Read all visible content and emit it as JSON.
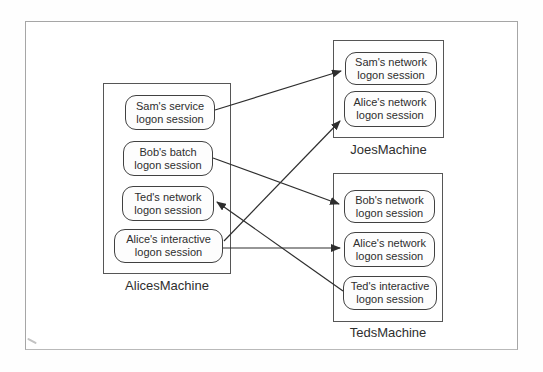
{
  "diagram": {
    "machines": [
      {
        "id": "alices-machine",
        "label": "AlicesMachine",
        "sessions": [
          {
            "id": "sam-service",
            "line1": "Sam's service",
            "line2": "logon session"
          },
          {
            "id": "bob-batch",
            "line1": "Bob's batch",
            "line2": "logon session"
          },
          {
            "id": "ted-network",
            "line1": "Ted's network",
            "line2": "logon session"
          },
          {
            "id": "alice-interactive",
            "line1": "Alice's interactive",
            "line2": "logon session"
          }
        ]
      },
      {
        "id": "joes-machine",
        "label": "JoesMachine",
        "sessions": [
          {
            "id": "sam-network",
            "line1": "Sam's network",
            "line2": "logon session"
          },
          {
            "id": "alice-network-joes",
            "line1": "Alice's network",
            "line2": "logon session"
          }
        ]
      },
      {
        "id": "teds-machine",
        "label": "TedsMachine",
        "sessions": [
          {
            "id": "bob-network",
            "line1": "Bob's network",
            "line2": "logon session"
          },
          {
            "id": "alice-network-teds",
            "line1": "Alice's network",
            "line2": "logon session"
          },
          {
            "id": "ted-interactive",
            "line1": "Ted's interactive",
            "line2": "logon session"
          }
        ]
      }
    ],
    "connections": [
      {
        "from": "sam-service",
        "to": "sam-network",
        "x1": 215,
        "y1": 110,
        "x2": 341,
        "y2": 71
      },
      {
        "from": "bob-batch",
        "to": "bob-network",
        "x1": 213,
        "y1": 158,
        "x2": 339,
        "y2": 204
      },
      {
        "from": "alice-interactive",
        "to": "alice-network-joes",
        "x1": 224,
        "y1": 241,
        "x2": 340,
        "y2": 121
      },
      {
        "from": "alice-interactive",
        "to": "alice-network-teds",
        "x1": 223,
        "y1": 248,
        "x2": 340,
        "y2": 248
      },
      {
        "from": "ted-interactive",
        "to": "ted-network",
        "x1": 343,
        "y1": 291,
        "x2": 217,
        "y2": 202
      }
    ],
    "colors": {
      "line": "#2e2e2e",
      "session_border": "#414141",
      "machine_border": "#565656",
      "frame_border": "#a6a6a6",
      "text": "#2e2e2e",
      "background": "#fefefe"
    }
  }
}
